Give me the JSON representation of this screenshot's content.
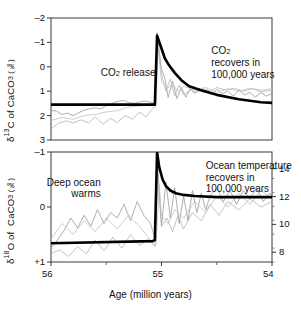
{
  "figure": {
    "xlabel": "Age (million years)",
    "xticks": [
      "56",
      "55",
      "54"
    ]
  },
  "panels": [
    {
      "id": "delta13c",
      "ylabel_parts": {
        "d": "δ",
        "iso": "13",
        "elem": "C of CaCO",
        "sub": "3",
        "unit": "(‰)"
      },
      "yticks": [
        "–2",
        "–1",
        "0",
        "1",
        "2",
        "3"
      ],
      "annotations": [
        {
          "name": "co2-release",
          "lines": [
            "CO2 release"
          ]
        },
        {
          "name": "co2-recovers",
          "lines": [
            "CO2",
            "recovers in",
            "100,000 years"
          ]
        }
      ]
    },
    {
      "id": "delta18o",
      "ylabel_parts": {
        "d": "δ",
        "iso": "18",
        "elem": "O of  CaCO",
        "sub": "3",
        "unit": "(‰)"
      },
      "yticks": [
        "–1",
        "0",
        "+1"
      ],
      "yticks_right": [
        "14",
        "12",
        "10",
        "8"
      ],
      "annotations": [
        {
          "name": "deep-ocean-warms",
          "lines": [
            "Deep ocean",
            "warms"
          ]
        },
        {
          "name": "ocean-temp-recovers",
          "lines": [
            "Ocean temperature",
            "recovers in",
            "100,000 years"
          ]
        }
      ]
    }
  ],
  "chart_data": {
    "type": "line",
    "title": "",
    "xlabel": "Age (million years)",
    "xlim": [
      56,
      54
    ],
    "xticks": [
      56,
      55,
      54
    ],
    "xminor": [
      55.5,
      54.5
    ],
    "grid": false,
    "legend": null,
    "panels": [
      {
        "name": "delta13c",
        "ylabel": "δ13C of CaCO3 (‰)",
        "ylim": [
          -2,
          3
        ],
        "yticks": [
          -2,
          -1,
          0,
          1,
          2,
          3
        ],
        "y_inverted": true,
        "annotations": [
          {
            "text": "CO2 release",
            "x": 55.55,
            "y": 0.0
          },
          {
            "text": "CO2 recovers in 100,000 years",
            "x": 54.55,
            "y": -0.9
          }
        ],
        "series": [
          {
            "name": "model",
            "color": "#000000",
            "width": 2.6,
            "x": [
              56.0,
              55.06,
              55.04,
              55.0,
              54.97,
              54.93,
              54.88,
              54.82,
              54.75,
              54.65,
              54.5,
              54.3,
              54.1,
              54.0
            ],
            "y": [
              1.55,
              1.55,
              -1.28,
              -0.75,
              -0.35,
              -0.05,
              0.25,
              0.55,
              0.8,
              0.95,
              1.15,
              1.33,
              1.45,
              1.48
            ]
          },
          {
            "name": "record-a",
            "color": "#9a9a9a",
            "width": 0.8,
            "x": [
              56.0,
              55.95,
              55.9,
              55.85,
              55.8,
              55.75,
              55.7,
              55.65,
              55.6,
              55.55,
              55.5,
              55.45,
              55.4,
              55.35,
              55.3,
              55.25,
              55.2,
              55.15,
              55.1,
              55.06,
              55.04,
              55.02,
              55.0,
              54.97,
              54.94,
              54.9,
              54.86,
              54.82,
              54.78,
              54.74,
              54.7,
              54.66,
              54.62,
              54.58,
              54.54,
              54.5,
              54.45,
              54.4,
              54.35,
              54.3,
              54.25,
              54.2,
              54.15,
              54.1,
              54.05,
              54.0
            ],
            "y": [
              1.78,
              1.82,
              1.95,
              1.9,
              2.0,
              1.88,
              1.78,
              1.72,
              1.68,
              1.72,
              1.6,
              1.5,
              1.42,
              1.38,
              1.45,
              1.5,
              1.44,
              1.4,
              1.45,
              1.5,
              -1.4,
              -0.6,
              0.1,
              0.45,
              1.25,
              0.6,
              1.3,
              0.85,
              1.25,
              0.9,
              1.1,
              0.88,
              1.05,
              0.95,
              1.15,
              0.92,
              1.1,
              1.0,
              1.2,
              0.95,
              1.15,
              1.05,
              1.25,
              1.05,
              1.2,
              1.1
            ]
          },
          {
            "name": "record-b",
            "color": "#b4b4b4",
            "width": 0.8,
            "x": [
              56.0,
              55.93,
              55.86,
              55.8,
              55.73,
              55.66,
              55.6,
              55.53,
              55.46,
              55.4,
              55.33,
              55.26,
              55.2,
              55.14,
              55.08,
              55.05,
              55.03,
              55.0,
              54.96,
              54.92,
              54.88,
              54.84,
              54.8,
              54.74,
              54.68,
              54.62,
              54.56,
              54.5,
              54.42,
              54.34,
              54.26,
              54.18,
              54.1,
              54.0
            ],
            "y": [
              2.55,
              2.3,
              2.22,
              2.3,
              2.18,
              2.3,
              2.05,
              2.35,
              2.12,
              2.28,
              2.0,
              2.15,
              1.85,
              2.05,
              1.7,
              1.6,
              -1.0,
              0.3,
              1.0,
              0.5,
              1.2,
              0.75,
              1.15,
              0.95,
              1.05,
              0.9,
              1.0,
              0.85,
              0.95,
              0.88,
              1.0,
              0.9,
              1.02,
              0.95
            ]
          },
          {
            "name": "record-c",
            "color": "#c0c0c0",
            "width": 0.8,
            "x": [
              56.0,
              55.9,
              55.8,
              55.7,
              55.6,
              55.5,
              55.4,
              55.3,
              55.2,
              55.12,
              55.06,
              55.03,
              55.0,
              54.95,
              54.9,
              54.85,
              54.8,
              54.7,
              54.6,
              54.5,
              54.4,
              54.3,
              54.2,
              54.1,
              54.0
            ],
            "y": [
              2.2,
              2.08,
              2.15,
              2.0,
              1.95,
              1.85,
              1.8,
              1.65,
              1.6,
              1.55,
              1.5,
              -0.8,
              0.6,
              0.9,
              0.7,
              1.0,
              0.8,
              0.95,
              0.85,
              1.05,
              0.9,
              1.0,
              0.88,
              0.95,
              0.9
            ]
          }
        ]
      },
      {
        "name": "delta18o",
        "ylabel": "δ18O of CaCO3 (‰)",
        "ylim": [
          -1,
          1
        ],
        "yticks": [
          -1,
          0,
          1
        ],
        "y_inverted": true,
        "right_axis": {
          "label": "temperature",
          "ticks": [
            8,
            10,
            12,
            14
          ],
          "lim": [
            7.3,
            15.2
          ]
        },
        "annotations": [
          {
            "text": "Deep ocean warms",
            "x": 55.55,
            "y": -0.55
          },
          {
            "text": "Ocean temperature recovers in 100,000 years",
            "x": 54.6,
            "y": -0.85
          }
        ],
        "series": [
          {
            "name": "model",
            "color": "#000000",
            "width": 2.6,
            "x": [
              56.0,
              55.08,
              55.06,
              55.04,
              55.02,
              54.99,
              54.96,
              54.92,
              54.87,
              54.8,
              54.7,
              54.5,
              54.2,
              54.0
            ],
            "y": [
              0.66,
              0.62,
              0.6,
              -1.0,
              -0.72,
              -0.5,
              -0.38,
              -0.3,
              -0.25,
              -0.22,
              -0.2,
              -0.18,
              -0.18,
              -0.18
            ]
          },
          {
            "name": "record-a",
            "color": "#9a9a9a",
            "width": 0.8,
            "x": [
              56.0,
              55.94,
              55.88,
              55.82,
              55.76,
              55.7,
              55.64,
              55.58,
              55.52,
              55.46,
              55.4,
              55.34,
              55.28,
              55.22,
              55.16,
              55.1,
              55.06,
              55.04,
              55.02,
              55.0,
              54.96,
              54.92,
              54.88,
              54.84,
              54.8,
              54.76,
              54.72,
              54.68,
              54.64,
              54.6,
              54.56,
              54.5,
              54.44,
              54.38,
              54.32,
              54.26,
              54.2,
              54.14,
              54.08,
              54.02,
              54.0
            ],
            "y": [
              0.75,
              0.6,
              0.42,
              0.2,
              0.38,
              0.15,
              0.35,
              0.05,
              0.3,
              0.1,
              0.2,
              -0.05,
              0.25,
              -0.1,
              0.15,
              0.3,
              0.55,
              -1.0,
              -0.2,
              0.35,
              -0.45,
              0.2,
              -0.35,
              0.3,
              -0.2,
              0.25,
              -0.3,
              0.1,
              -0.25,
              0.05,
              -0.2,
              -0.35,
              -0.1,
              -0.3,
              -0.05,
              -0.3,
              -0.15,
              -0.35,
              -0.1,
              -0.25,
              -0.2
            ]
          },
          {
            "name": "record-b",
            "color": "#b4b4b4",
            "width": 0.8,
            "x": [
              56.0,
              55.92,
              55.84,
              55.76,
              55.68,
              55.6,
              55.52,
              55.44,
              55.36,
              55.28,
              55.2,
              55.12,
              55.06,
              55.03,
              55.0,
              54.95,
              54.9,
              54.85,
              54.8,
              54.72,
              54.64,
              54.56,
              54.48,
              54.4,
              54.3,
              54.2,
              54.1,
              54.0
            ],
            "y": [
              0.85,
              0.78,
              0.9,
              0.72,
              0.85,
              0.6,
              0.8,
              0.55,
              0.75,
              0.5,
              0.7,
              0.58,
              0.72,
              -0.6,
              0.35,
              0.2,
              0.45,
              0.15,
              0.4,
              0.1,
              0.25,
              -0.05,
              0.15,
              -0.1,
              0.05,
              -0.15,
              0.0,
              -0.1
            ]
          },
          {
            "name": "record-c",
            "color": "#c0c0c0",
            "width": 0.8,
            "x": [
              56.0,
              55.9,
              55.8,
              55.7,
              55.6,
              55.5,
              55.4,
              55.3,
              55.2,
              55.1,
              55.05,
              55.02,
              55.0,
              54.94,
              54.88,
              54.8,
              54.7,
              54.6,
              54.5,
              54.4,
              54.3,
              54.2,
              54.1,
              54.0
            ],
            "y": [
              0.58,
              0.3,
              0.5,
              0.25,
              0.45,
              0.2,
              0.4,
              0.15,
              0.35,
              0.6,
              0.7,
              -0.4,
              0.15,
              0.3,
              0.05,
              0.2,
              -0.1,
              0.1,
              -0.2,
              0.0,
              -0.25,
              -0.05,
              -0.3,
              -0.15
            ]
          }
        ]
      }
    ]
  }
}
